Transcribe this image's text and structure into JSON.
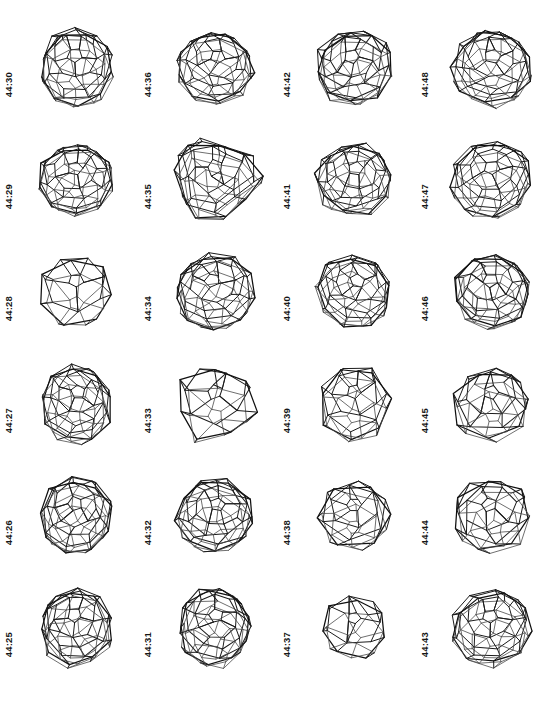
{
  "figure": {
    "kind": "fullerene-isomer-plate",
    "atom_count": 44,
    "columns": 4,
    "rows": 6,
    "ink_color": "#1b1b1b",
    "background_color": "#ffffff"
  },
  "cells": [
    {
      "label": "44:30",
      "row": 1,
      "col": 1,
      "seed": 30,
      "shape": "ovoid",
      "size": 104,
      "rings": 5,
      "tilt": -6
    },
    {
      "label": "44:36",
      "row": 1,
      "col": 2,
      "seed": 36,
      "shape": "round",
      "size": 100,
      "rings": 5,
      "tilt": 14
    },
    {
      "label": "44:42",
      "row": 1,
      "col": 3,
      "seed": 42,
      "shape": "round",
      "size": 102,
      "rings": 5,
      "tilt": -10
    },
    {
      "label": "44:48",
      "row": 1,
      "col": 4,
      "seed": 48,
      "shape": "round",
      "size": 104,
      "rings": 5,
      "tilt": 4
    },
    {
      "label": "44:29",
      "row": 2,
      "col": 1,
      "seed": 29,
      "shape": "round",
      "size": 100,
      "rings": 5,
      "tilt": -4
    },
    {
      "label": "44:35",
      "row": 2,
      "col": 2,
      "seed": 35,
      "shape": "trefoil",
      "size": 108,
      "rings": 5,
      "tilt": 0
    },
    {
      "label": "44:41",
      "row": 2,
      "col": 3,
      "seed": 41,
      "shape": "round",
      "size": 100,
      "rings": 5,
      "tilt": 8
    },
    {
      "label": "44:47",
      "row": 2,
      "col": 4,
      "seed": 47,
      "shape": "round",
      "size": 104,
      "rings": 5,
      "tilt": -2
    },
    {
      "label": "44:28",
      "row": 3,
      "col": 1,
      "seed": 28,
      "shape": "round",
      "size": 98,
      "rings": 3,
      "tilt": 0
    },
    {
      "label": "44:34",
      "row": 3,
      "col": 2,
      "seed": 34,
      "shape": "round",
      "size": 104,
      "rings": 5,
      "tilt": -12
    },
    {
      "label": "44:40",
      "row": 3,
      "col": 3,
      "seed": 40,
      "shape": "round",
      "size": 100,
      "rings": 5,
      "tilt": 18
    },
    {
      "label": "44:46",
      "row": 3,
      "col": 4,
      "seed": 46,
      "shape": "round",
      "size": 102,
      "rings": 5,
      "tilt": -8
    },
    {
      "label": "44:27",
      "row": 4,
      "col": 1,
      "seed": 27,
      "shape": "ovoid",
      "size": 100,
      "rings": 5,
      "tilt": 10
    },
    {
      "label": "44:33",
      "row": 4,
      "col": 2,
      "seed": 33,
      "shape": "trefoil",
      "size": 102,
      "rings": 3,
      "tilt": 0
    },
    {
      "label": "44:39",
      "row": 4,
      "col": 3,
      "seed": 39,
      "shape": "ovoid",
      "size": 100,
      "rings": 4,
      "tilt": 0
    },
    {
      "label": "44:45",
      "row": 4,
      "col": 4,
      "seed": 45,
      "shape": "round",
      "size": 102,
      "rings": 4,
      "tilt": -6
    },
    {
      "label": "44:26",
      "row": 5,
      "col": 1,
      "seed": 26,
      "shape": "ovoid",
      "size": 102,
      "rings": 5,
      "tilt": -4
    },
    {
      "label": "44:32",
      "row": 5,
      "col": 2,
      "seed": 32,
      "shape": "round",
      "size": 102,
      "rings": 5,
      "tilt": 12
    },
    {
      "label": "44:38",
      "row": 5,
      "col": 3,
      "seed": 38,
      "shape": "hexagonal",
      "size": 96,
      "rings": 4,
      "tilt": 0
    },
    {
      "label": "44:44",
      "row": 5,
      "col": 4,
      "seed": 44,
      "shape": "round",
      "size": 102,
      "rings": 4,
      "tilt": -14
    },
    {
      "label": "44:25",
      "row": 6,
      "col": 1,
      "seed": 25,
      "shape": "ovoid",
      "size": 102,
      "rings": 5,
      "tilt": -8
    },
    {
      "label": "44:31",
      "row": 6,
      "col": 2,
      "seed": 31,
      "shape": "ovoid",
      "size": 102,
      "rings": 5,
      "tilt": 6
    },
    {
      "label": "44:37",
      "row": 6,
      "col": 3,
      "seed": 37,
      "shape": "round",
      "size": 88,
      "rings": 3,
      "tilt": 0
    },
    {
      "label": "44:43",
      "row": 6,
      "col": 4,
      "seed": 43,
      "shape": "round",
      "size": 104,
      "rings": 5,
      "tilt": -10
    }
  ]
}
